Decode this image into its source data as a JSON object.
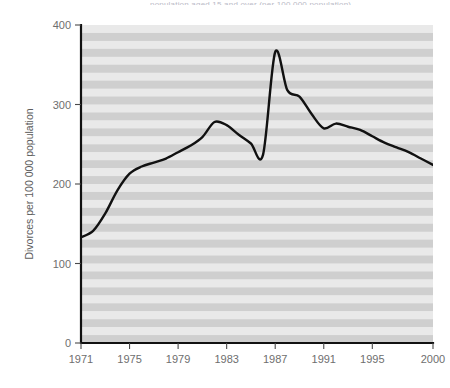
{
  "figure": {
    "top_caption_clipped": "population aged 15 and over (per 100 000 population)",
    "background_color": "#ffffff"
  },
  "chart_data": {
    "type": "line",
    "title": "",
    "subtitle": "",
    "xlabel": "",
    "ylabel": "Divorces per 100 000 population",
    "x": [
      1971,
      1972,
      1973,
      1974,
      1975,
      1976,
      1977,
      1978,
      1979,
      1980,
      1981,
      1982,
      1983,
      1984,
      1985,
      1986,
      1987,
      1988,
      1989,
      1990,
      1991,
      1992,
      1993,
      1994,
      1995,
      1996,
      1997,
      1998,
      1999,
      2000
    ],
    "series": [
      {
        "name": "Divorces per 100 000 population",
        "color": "#111111",
        "values": [
          133,
          141,
          163,
          192,
          213,
          222,
          227,
          232,
          240,
          248,
          259,
          278,
          274,
          262,
          251,
          237,
          366,
          318,
          310,
          288,
          270,
          276,
          272,
          268,
          260,
          252,
          246,
          240,
          232,
          224
        ]
      }
    ],
    "xlim": [
      1971,
      2000
    ],
    "ylim": [
      0,
      400
    ],
    "xticks": [
      1971,
      1975,
      1979,
      1983,
      1987,
      1991,
      1995,
      2000
    ],
    "xtick_labels": [
      "1971",
      "1975",
      "1979",
      "1983",
      "1987",
      "1991",
      "1995",
      "2000"
    ],
    "yticks": [
      0,
      100,
      200,
      300,
      400
    ],
    "ytick_labels": [
      "0",
      "100",
      "200",
      "300",
      "400"
    ],
    "grid": false,
    "banded_background": {
      "enabled": true,
      "band_color_dark": "#cfcfcf",
      "band_color_light": "#e9e9e9",
      "band_count": 40
    },
    "legend": {
      "visible": false,
      "position": "none"
    },
    "annotations": []
  }
}
